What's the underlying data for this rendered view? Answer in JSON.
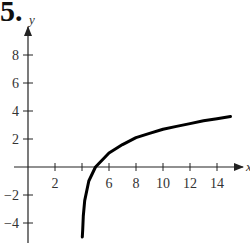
{
  "problem_number": "5.",
  "chart_data": {
    "type": "line",
    "title": "",
    "xlabel": "x",
    "ylabel": "y",
    "xlim": [
      -1,
      16
    ],
    "ylim": [
      -5,
      10
    ],
    "x_ticks": [
      2,
      4,
      6,
      8,
      10,
      12,
      14
    ],
    "x_tick_labels": [
      "2",
      "",
      "6",
      "8",
      "10",
      "12",
      "14"
    ],
    "y_ticks": [
      -4,
      -2,
      2,
      4,
      6,
      8
    ],
    "y_tick_labels": [
      "−4",
      "−2",
      "2",
      "4",
      "6",
      "8"
    ],
    "grid": false,
    "series": [
      {
        "name": "f(x)",
        "description": "logarithmic curve with vertical asymptote at x = 4, x-intercept at x = 5",
        "x": [
          4.02,
          4.05,
          4.1,
          4.2,
          4.5,
          5,
          6,
          7,
          8,
          9,
          10,
          11,
          12,
          13,
          14,
          15
        ],
        "y": [
          -5.0,
          -4.5,
          -3.5,
          -2.4,
          -1.0,
          0.0,
          1.0,
          1.6,
          2.1,
          2.4,
          2.7,
          2.9,
          3.1,
          3.3,
          3.45,
          3.6
        ]
      }
    ]
  },
  "colors": {
    "axis": "#222222",
    "curve": "#000000",
    "text": "#333333"
  }
}
